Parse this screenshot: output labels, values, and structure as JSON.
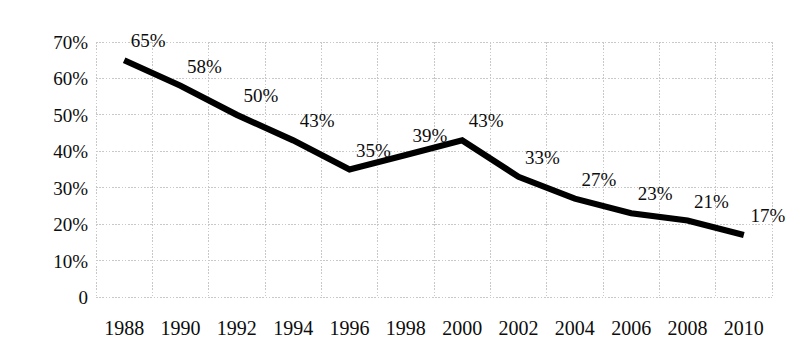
{
  "chart_data": {
    "type": "line",
    "title": "",
    "subtitle": "",
    "xlabel": "",
    "ylabel": "",
    "categories": [
      "1988",
      "1990",
      "1992",
      "1994",
      "1996",
      "1998",
      "2000",
      "2002",
      "2004",
      "2006",
      "2008",
      "2010"
    ],
    "values": [
      65,
      58,
      50,
      43,
      35,
      39,
      43,
      33,
      27,
      23,
      21,
      17
    ],
    "point_labels": [
      "65%",
      "58%",
      "50%",
      "43%",
      "35%",
      "39%",
      "43%",
      "33%",
      "27%",
      "23%",
      "21%",
      "17%"
    ],
    "ylim": [
      0,
      70
    ],
    "ytick_values": [
      70,
      60,
      50,
      40,
      30,
      20,
      10,
      0
    ],
    "ytick_labels": [
      "70%",
      "60%",
      "50%",
      "40%",
      "30%",
      "20%",
      "10%",
      "0"
    ],
    "grid": true,
    "legend": "none",
    "series": [
      {
        "name": "series-1",
        "color": "#000000",
        "values": [
          65,
          58,
          50,
          43,
          35,
          39,
          43,
          33,
          27,
          23,
          21,
          17
        ]
      }
    ],
    "colors": {
      "line": "#000000",
      "grid": "#c8c8c8",
      "background": "#ffffff",
      "text": "#0d0d0d"
    }
  }
}
